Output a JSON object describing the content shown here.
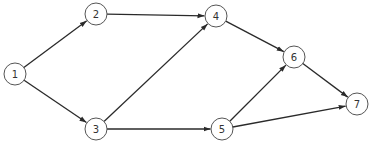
{
  "diagram": {
    "type": "directed-network",
    "node_radius": 11,
    "colors": {
      "edge": "#2a2a2a",
      "node_stroke": "#555555",
      "node_fill": "#ffffff",
      "label": "#333333"
    },
    "nodes": [
      {
        "id": "1",
        "label": "1",
        "x": 15,
        "y": 74
      },
      {
        "id": "2",
        "label": "2",
        "x": 96,
        "y": 14
      },
      {
        "id": "3",
        "label": "3",
        "x": 96,
        "y": 129
      },
      {
        "id": "4",
        "label": "4",
        "x": 216,
        "y": 16
      },
      {
        "id": "5",
        "label": "5",
        "x": 222,
        "y": 129
      },
      {
        "id": "6",
        "label": "6",
        "x": 294,
        "y": 57
      },
      {
        "id": "7",
        "label": "7",
        "x": 357,
        "y": 104
      }
    ],
    "edges": [
      {
        "from": "1",
        "to": "2"
      },
      {
        "from": "1",
        "to": "3"
      },
      {
        "from": "2",
        "to": "4"
      },
      {
        "from": "3",
        "to": "4"
      },
      {
        "from": "3",
        "to": "5"
      },
      {
        "from": "4",
        "to": "6"
      },
      {
        "from": "5",
        "to": "6"
      },
      {
        "from": "5",
        "to": "7"
      },
      {
        "from": "6",
        "to": "7"
      }
    ]
  }
}
